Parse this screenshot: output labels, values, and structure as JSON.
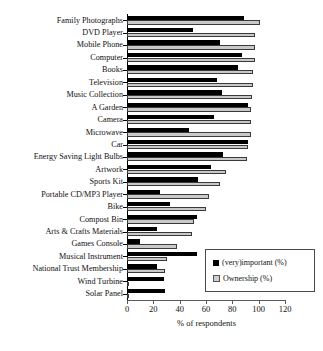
{
  "chart_data": {
    "type": "bar",
    "orientation": "horizontal",
    "title": "",
    "xlabel": "% of respondents",
    "ylabel": "",
    "xlim": [
      0,
      120
    ],
    "xticks": [
      0,
      20,
      40,
      60,
      80,
      100,
      120
    ],
    "grid": false,
    "legend_position": "bottom-right",
    "categories": [
      "Family Photographs",
      "DVD Player",
      "Mobile Phone",
      "Computer",
      "Books",
      "Television",
      "Music Collection",
      "A Garden",
      "Camera",
      "Microwave",
      "Car",
      "Energy Saving Light Bulbs",
      "Artwork",
      "Sports Kit",
      "Portable CD/MP3 Player",
      "Bike",
      "Compost Bin",
      "Arts & Crafts Materials",
      "Games Console",
      "Musical Instrument",
      "National Trust Membership",
      "Wind Turbine",
      "Solar Panel"
    ],
    "series": [
      {
        "name": "(very)important (%)",
        "color": "#000000",
        "values": [
          89,
          50,
          71,
          87,
          84,
          68,
          72,
          92,
          66,
          47,
          92,
          73,
          64,
          54,
          25,
          33,
          53,
          23,
          10,
          53,
          23,
          28,
          29
        ]
      },
      {
        "name": "Ownership (%)",
        "color": "#c9c9c9",
        "values": [
          101,
          97,
          97,
          97,
          96,
          96,
          95,
          94,
          94,
          94,
          92,
          91,
          75,
          71,
          62,
          60,
          51,
          49,
          38,
          30,
          29,
          1,
          1
        ]
      }
    ]
  },
  "legend": {
    "items": [
      {
        "label": "(very)important (%)",
        "swatch": "black-square"
      },
      {
        "label": "Ownership (%)",
        "swatch": "gray-square"
      }
    ]
  },
  "axis": {
    "x_title": "% of respondents",
    "tick_labels": [
      "0",
      "20",
      "40",
      "60",
      "80",
      "100",
      "120"
    ]
  }
}
